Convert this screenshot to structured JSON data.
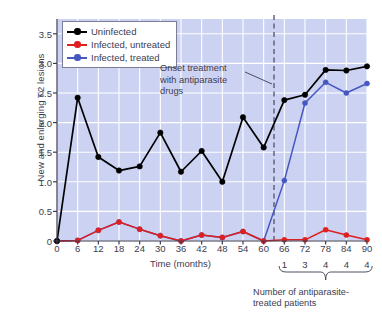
{
  "chart_data": {
    "type": "line",
    "title": "",
    "xlabel": "Time (months)",
    "ylabel": "New and enlarging T2 lesions",
    "x": [
      0,
      6,
      12,
      18,
      24,
      30,
      36,
      42,
      48,
      54,
      60,
      66,
      72,
      78,
      84,
      90
    ],
    "xlim": [
      0,
      90
    ],
    "ylim": [
      0,
      3.75
    ],
    "yticks": [
      0,
      0.5,
      1.0,
      1.5,
      2.0,
      2.5,
      3.0,
      3.5
    ],
    "ytick_labels": [
      "0",
      "0.5",
      "1.0",
      "1.5",
      "2.0",
      "2.5",
      "3.0",
      "3.5"
    ],
    "xticks": [
      0,
      6,
      12,
      18,
      24,
      30,
      36,
      42,
      48,
      54,
      60,
      66,
      72,
      78,
      84,
      90
    ],
    "xtick_labels": [
      "0",
      "6",
      "12",
      "18",
      "24",
      "30",
      "36",
      "42",
      "48",
      "54",
      "60",
      "66",
      "72",
      "78",
      "84",
      "90"
    ],
    "grid": true,
    "legend_position": "upper-left",
    "series": [
      {
        "name": "Uninfected",
        "color": "#000000",
        "marker": "circle",
        "values": [
          0.0,
          2.42,
          1.42,
          1.19,
          1.26,
          1.83,
          1.17,
          1.52,
          1.0,
          2.09,
          1.58,
          2.38,
          2.47,
          2.89,
          2.88,
          2.95
        ]
      },
      {
        "name": "Infected, untreated",
        "color": "#e02020",
        "marker": "circle",
        "values": [
          0.0,
          0.01,
          0.18,
          0.32,
          0.2,
          0.09,
          0.0,
          0.1,
          0.06,
          0.16,
          0.0,
          0.02,
          0.02,
          0.19,
          0.1,
          0.02
        ]
      },
      {
        "name": "Infected, treated",
        "color": "#4657c0",
        "marker": "circle",
        "values": [
          0.0,
          0.01,
          0.18,
          0.32,
          0.2,
          0.09,
          0.0,
          0.1,
          0.06,
          0.16,
          0.0,
          1.02,
          2.33,
          2.68,
          2.5,
          2.66
        ]
      }
    ],
    "annotations": [
      {
        "name": "onset-treatment",
        "lines": [
          "Onset treatment",
          "with antiparasite",
          "drugs"
        ],
        "pointer_x": 63
      }
    ],
    "vline": {
      "x": 63,
      "style": "dashed",
      "color": "#5a5a78"
    },
    "secondary_axis": {
      "caption": [
        "Number of antiparasite-",
        "treated patients"
      ],
      "x": [
        66,
        72,
        78,
        84,
        90
      ],
      "values": [
        "1",
        "3",
        "4",
        "4",
        "4"
      ]
    }
  },
  "colors": {
    "plot_background": "#ccd2f1",
    "grid": "#ffffff",
    "text": "#3c3c50",
    "uninfected": "#000000",
    "untreated": "#e02020",
    "treated": "#4657c0",
    "vline": "#5a5a78"
  }
}
